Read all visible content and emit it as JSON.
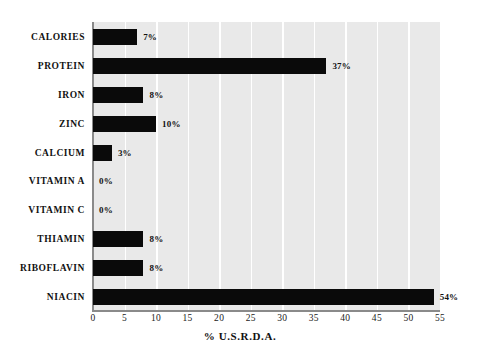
{
  "chart_data": {
    "type": "bar",
    "orientation": "horizontal",
    "title": "",
    "xlabel": "% U.S.R.D.A.",
    "ylabel": "",
    "xlim": [
      0,
      55
    ],
    "xticks": [
      0,
      5,
      10,
      15,
      20,
      25,
      30,
      35,
      40,
      45,
      50,
      55
    ],
    "xtick_labels": [
      "0",
      "5",
      "10",
      "15",
      "20",
      "25",
      "30",
      "35",
      "40",
      "45",
      "50",
      "55"
    ],
    "grid": "vertical-white-gridlines",
    "legend": "none",
    "categories": [
      "CALORIES",
      "PROTEIN",
      "IRON",
      "ZINC",
      "CALCIUM",
      "VITAMIN A",
      "VITAMIN C",
      "THIAMIN",
      "RIBOFLAVIN",
      "NIACIN"
    ],
    "values": [
      7,
      37,
      8,
      10,
      3,
      0,
      0,
      8,
      8,
      54
    ],
    "data_labels": [
      "7%",
      "37%",
      "8%",
      "10%",
      "3%",
      "0%",
      "0%",
      "8%",
      "8%",
      "54%"
    ],
    "bar_color": "#0a0a0a",
    "plot_background": "#e9e9e9",
    "gridline_color": "#ffffff",
    "axis_color": "#8a8a8a"
  }
}
